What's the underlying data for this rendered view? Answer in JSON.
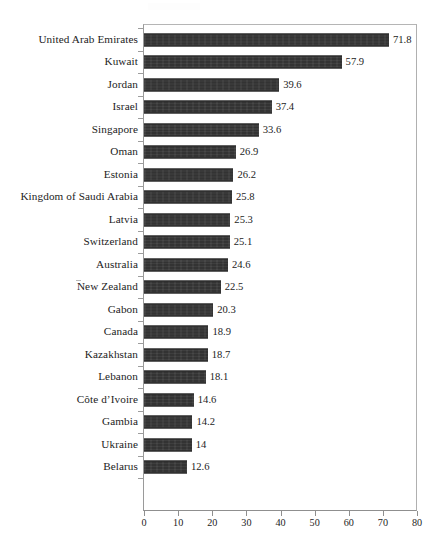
{
  "chart_data": {
    "type": "bar",
    "orientation": "horizontal",
    "title": "",
    "subtitle": "",
    "xlabel": "",
    "ylabel": "",
    "xlim": [
      0,
      80
    ],
    "xticks": [
      0,
      10,
      20,
      30,
      40,
      50,
      60,
      70,
      80
    ],
    "xtick_labels": [
      "0",
      "10",
      "20",
      "30",
      "40",
      "50",
      "60",
      "70",
      "80"
    ],
    "grid": false,
    "legend": null,
    "bar_color": "#333333",
    "value_labels": true,
    "categories": [
      "United Arab Emirates",
      "Kuwait",
      "Jordan",
      "Israel",
      "Singapore",
      "Oman",
      "Estonia",
      "Kingdom of Saudi Arabia",
      "Latvia",
      "Switzerland",
      "Australia",
      "New Zealand",
      "Gabon",
      "Canada",
      "Kazakhstan",
      "Lebanon",
      "Côte d’Ivoire",
      "Gambia",
      "Ukraine",
      "Belarus"
    ],
    "values": [
      71.8,
      57.9,
      39.6,
      37.4,
      33.6,
      26.9,
      26.2,
      25.8,
      25.3,
      25.1,
      24.6,
      22.5,
      20.3,
      18.9,
      18.7,
      18.1,
      14.6,
      14.2,
      14,
      12.6
    ],
    "value_label_texts": [
      "71.8",
      "57.9",
      "39.6",
      "37.4",
      "33.6",
      "26.9",
      "26.2",
      "25.8",
      "25.3",
      "25.1",
      "24.6",
      "22.5",
      "20.3",
      "18.9",
      "18.7",
      "18.1",
      "14.6",
      "14.2",
      "14",
      "12.6"
    ]
  }
}
